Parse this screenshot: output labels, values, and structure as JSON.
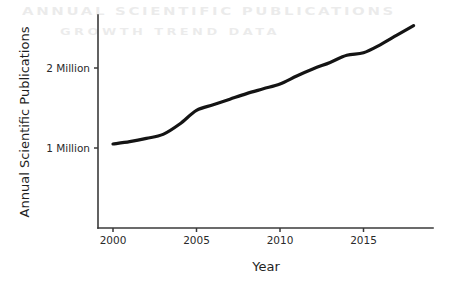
{
  "figure": {
    "background_color": "#ffffff",
    "ghost_artifact_1": "ANNUAL SCIENTIFIC PUBLICATIONS",
    "ghost_artifact_2": "GROWTH TREND DATA"
  },
  "chart_data": {
    "type": "line",
    "title": "",
    "xlabel": "Year",
    "ylabel": "Annual Scientific Publications",
    "xlim": [
      1999,
      2019.2
    ],
    "ylim": [
      0.0,
      2.72
    ],
    "grid": false,
    "legend": null,
    "line_color": "#141414",
    "line_width": 3.2,
    "x_tick_labels": [
      "2000",
      "2005",
      "2010",
      "2015"
    ],
    "x_ticks": [
      2000,
      2005,
      2010,
      2015
    ],
    "y_tick_labels": [
      "1 Million",
      "2 Million"
    ],
    "y_ticks": [
      1.0,
      2.0
    ],
    "y_unit": "millions of publications",
    "x": [
      2000,
      2001,
      2002,
      2003,
      2004,
      2005,
      2006,
      2007,
      2008,
      2009,
      2010,
      2011,
      2012,
      2013,
      2014,
      2015,
      2016,
      2017,
      2018
    ],
    "values": [
      1.05,
      1.08,
      1.12,
      1.17,
      1.3,
      1.47,
      1.54,
      1.61,
      1.68,
      1.74,
      1.8,
      1.9,
      1.99,
      2.07,
      2.16,
      2.19,
      2.29,
      2.41,
      2.53
    ],
    "series": [
      {
        "name": "Annual Scientific Publications",
        "values": [
          1.05,
          1.08,
          1.12,
          1.17,
          1.3,
          1.47,
          1.54,
          1.61,
          1.68,
          1.74,
          1.8,
          1.9,
          1.99,
          2.07,
          2.16,
          2.19,
          2.29,
          2.41,
          2.53
        ]
      }
    ]
  },
  "axes_geometry": {
    "left": 98,
    "right": 433,
    "top": 15,
    "bottom": 228,
    "x_pixel_2000": 113,
    "x_pixel_per_year": 16.7,
    "y_pixel_1million": 148,
    "y_pixel_2million": 68
  }
}
